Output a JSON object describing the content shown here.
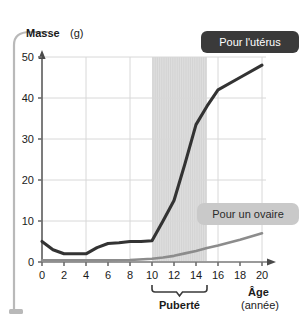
{
  "chart_data": {
    "type": "line",
    "title": "",
    "xlabel": "Âge",
    "xlabel_unit": "(année)",
    "ylabel": "Masse",
    "ylabel_unit": "(g)",
    "xlim": [
      0,
      20
    ],
    "ylim": [
      0,
      50
    ],
    "grid": true,
    "legend_position": "inside-right",
    "x_ticks": [
      "0",
      "2",
      "4",
      "6",
      "8",
      "10",
      "12",
      "14",
      "16",
      "18",
      "20"
    ],
    "y_ticks": [
      "0",
      "10",
      "20",
      "30",
      "40",
      "50"
    ],
    "series": [
      {
        "name": "Pour l'utérus",
        "color": "#333333",
        "x": [
          0,
          1,
          2,
          3,
          4,
          5,
          6,
          7,
          8,
          9,
          10,
          11,
          12,
          13,
          14,
          15,
          16,
          18,
          20
        ],
        "values": [
          5,
          3,
          2,
          2,
          2,
          3.5,
          4.5,
          4.7,
          5,
          5,
          5.2,
          10,
          15,
          24,
          33.5,
          38,
          42,
          45,
          48
        ]
      },
      {
        "name": "Pour un ovaire",
        "color": "#8c8c8c",
        "x": [
          0,
          2,
          4,
          6,
          8,
          10,
          11,
          12,
          13,
          14,
          15,
          16,
          18,
          20
        ],
        "values": [
          0.4,
          0.4,
          0.4,
          0.4,
          0.5,
          0.8,
          1.1,
          1.5,
          2.1,
          2.7,
          3.4,
          4.0,
          5.4,
          7.0
        ]
      }
    ],
    "annotations": [
      {
        "name": "puberty-band",
        "label": "Puberté",
        "x_start": 10,
        "x_end": 15,
        "fill": "#dcdcdc"
      }
    ]
  },
  "legend": {
    "uterus": {
      "label": "Pour l'utérus",
      "background": "#3a3a3a",
      "text_color": "#ffffff"
    },
    "ovary": {
      "label": "Pour un ovaire",
      "background": "#c9c9c9",
      "text_color": "#2b2b2b"
    }
  },
  "axes": {
    "y_title": "Masse",
    "y_unit": "(g)",
    "x_title": "Âge",
    "x_unit": "(année)"
  },
  "band": {
    "label": "Puberté"
  }
}
